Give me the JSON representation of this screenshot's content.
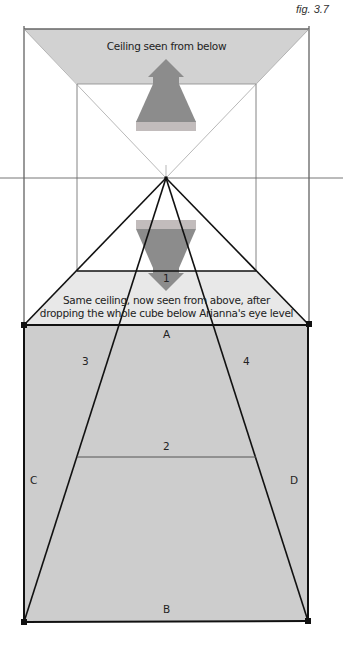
{
  "figure": {
    "label": "fig. 3.7"
  },
  "annotations": {
    "ceiling_top": "Ceiling seen from below",
    "ceiling_bottom_line1": "Same ceiling, now seen from above, after",
    "ceiling_bottom_line2": "dropping the whole cube below Arianna's eye level"
  },
  "markers": {
    "line_1": "1",
    "line_2": "2",
    "line_3": "3",
    "line_4": "4",
    "edge_a": "A",
    "edge_b": "B",
    "edge_c": "C",
    "edge_d": "D"
  },
  "colors": {
    "ceiling_fill": "#d2d2d2",
    "trapezoid_fill": "#e8e8e8",
    "floor_fill": "#cdcdcd",
    "arrow_fill": "#8c8c8c",
    "arrow_band": "#c2bcbc",
    "line": "#111111",
    "thin_line": "#555555"
  }
}
